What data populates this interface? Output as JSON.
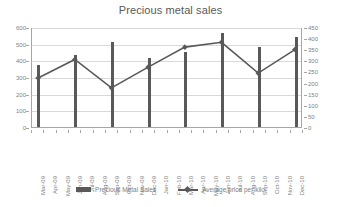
{
  "chart_data": {
    "type": "bar",
    "title": "Precious metal sales",
    "xlabel": "",
    "ylabel": "",
    "grid": true,
    "legend_position": "bottom",
    "categories": [
      "Mar-09",
      "Apr-09",
      "May-09",
      "Jun-09",
      "Jul-09",
      "Aug-09",
      "Sep-09",
      "Oct-09",
      "Nov-09",
      "Dec-09",
      "Jan-10",
      "Feb-10",
      "Mar-10",
      "Apr-10",
      "May-10",
      "Jun-10",
      "Jul-10",
      "Aug-10",
      "Sep-10",
      "Oct-10",
      "Nov-10",
      "Dec-10"
    ],
    "y_left_axis": {
      "ticks": [
        0,
        100,
        200,
        300,
        400,
        500,
        600
      ],
      "ylim": [
        0,
        600
      ]
    },
    "y_right_axis": {
      "ticks": [
        0,
        50,
        100,
        150,
        200,
        250,
        300,
        350,
        400,
        450
      ],
      "ylim": [
        0,
        450
      ]
    },
    "series": [
      {
        "name": "Precious Metal Sales",
        "type": "bar",
        "axis": "left",
        "color": "#595959",
        "values": [
          375,
          null,
          null,
          432,
          null,
          null,
          513,
          null,
          null,
          417,
          null,
          null,
          452,
          null,
          null,
          562,
          null,
          null,
          478,
          null,
          null,
          538
        ]
      },
      {
        "name": "Average price per kilo",
        "type": "line",
        "axis": "right",
        "color": "#595959",
        "values": [
          223,
          null,
          null,
          307,
          null,
          null,
          178,
          null,
          null,
          272,
          null,
          null,
          363,
          null,
          null,
          385,
          null,
          null,
          245,
          null,
          null,
          352
        ]
      }
    ]
  },
  "legend": {
    "items": [
      {
        "label": "Precious Metal Sales"
      },
      {
        "label": "Average price per kilo"
      }
    ]
  }
}
